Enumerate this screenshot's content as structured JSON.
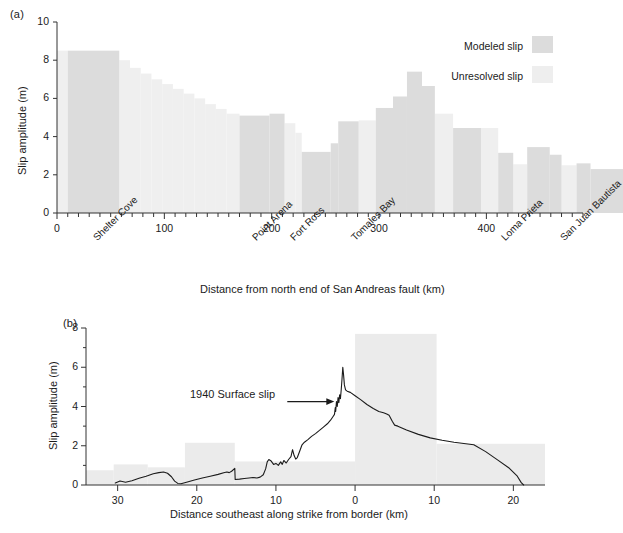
{
  "figure": {
    "panel_a_label": "(a)",
    "panel_b_label": "(b)"
  },
  "legend": {
    "modeled_label": "Modeled slip",
    "unresolved_label": "Unresolved slip",
    "modeled_color": "#dcdcdc",
    "unresolved_color": "#eeeeee"
  },
  "panel_a": {
    "ylabel": "Slip amplitude (m)",
    "xlabel": "Distance from north end of San Andreas fault (km)",
    "yticks": [
      "0",
      "2",
      "4",
      "6",
      "8",
      "10"
    ],
    "xticks": [
      "0",
      "100",
      "200",
      "300",
      "400"
    ],
    "categories": [
      {
        "label": "Shelter Cove",
        "km": 30
      },
      {
        "label": "Point Arena",
        "km": 178
      },
      {
        "label": "Fort Ross",
        "km": 213
      },
      {
        "label": "Tomales Bay",
        "km": 270
      },
      {
        "label": "Loma Prieta",
        "km": 410
      },
      {
        "label": "San Juan Bautista",
        "km": 465
      }
    ]
  },
  "panel_b": {
    "ylabel": "Slip amplitude (m)",
    "xlabel": "Distance southeast along strike from border (km)",
    "yticks": [
      "0",
      "2",
      "4",
      "6",
      "8"
    ],
    "xticks": [
      "30",
      "20",
      "10",
      "0",
      "10",
      "20"
    ],
    "annotation": "1940 Surface slip"
  },
  "chart_data": [
    {
      "type": "bar",
      "title": "(a)",
      "xlabel": "Distance from north end of San Andreas fault (km)",
      "ylabel": "Slip amplitude (m)",
      "xlim": [
        0,
        490
      ],
      "ylim": [
        0,
        10
      ],
      "grid": false,
      "legend_position": "top-right",
      "series": [
        {
          "name": "Modeled slip",
          "color": "#dcdcdc",
          "bars": [
            {
              "x0": 10,
              "x1": 58,
              "value": 8.5
            },
            {
              "x0": 170,
              "x1": 198,
              "value": 5.1
            },
            {
              "x0": 198,
              "x1": 212,
              "value": 5.2
            },
            {
              "x0": 228,
              "x1": 255,
              "value": 3.2
            },
            {
              "x0": 255,
              "x1": 262,
              "value": 3.65
            },
            {
              "x0": 262,
              "x1": 281,
              "value": 4.8
            },
            {
              "x0": 297,
              "x1": 313,
              "value": 5.5
            },
            {
              "x0": 313,
              "x1": 326,
              "value": 6.1
            },
            {
              "x0": 326,
              "x1": 340,
              "value": 7.4
            },
            {
              "x0": 340,
              "x1": 352,
              "value": 6.65
            },
            {
              "x0": 369,
              "x1": 395,
              "value": 4.45
            },
            {
              "x0": 411,
              "x1": 425,
              "value": 3.15
            },
            {
              "x0": 438,
              "x1": 459,
              "value": 3.45
            },
            {
              "x0": 459,
              "x1": 470,
              "value": 3.05
            },
            {
              "x0": 484,
              "x1": 497,
              "value": 2.6
            },
            {
              "x0": 497,
              "x1": 530,
              "value": 2.3
            }
          ]
        },
        {
          "name": "Unresolved slip",
          "color": "#efefef",
          "bars": [
            {
              "x0": 0,
              "x1": 10,
              "value": 8.5
            },
            {
              "x0": 58,
              "x1": 68,
              "value": 8.0
            },
            {
              "x0": 68,
              "x1": 78,
              "value": 7.6
            },
            {
              "x0": 78,
              "x1": 88,
              "value": 7.3
            },
            {
              "x0": 88,
              "x1": 98,
              "value": 7.0
            },
            {
              "x0": 98,
              "x1": 108,
              "value": 6.75
            },
            {
              "x0": 108,
              "x1": 118,
              "value": 6.5
            },
            {
              "x0": 118,
              "x1": 128,
              "value": 6.25
            },
            {
              "x0": 128,
              "x1": 138,
              "value": 6.0
            },
            {
              "x0": 138,
              "x1": 148,
              "value": 5.7
            },
            {
              "x0": 148,
              "x1": 158,
              "value": 5.45
            },
            {
              "x0": 158,
              "x1": 170,
              "value": 5.2
            },
            {
              "x0": 212,
              "x1": 222,
              "value": 4.7
            },
            {
              "x0": 222,
              "x1": 228,
              "value": 4.2
            },
            {
              "x0": 281,
              "x1": 297,
              "value": 4.85
            },
            {
              "x0": 352,
              "x1": 369,
              "value": 5.2
            },
            {
              "x0": 395,
              "x1": 411,
              "value": 4.45
            },
            {
              "x0": 425,
              "x1": 438,
              "value": 2.55
            },
            {
              "x0": 470,
              "x1": 484,
              "value": 2.5
            }
          ]
        }
      ]
    },
    {
      "type": "line",
      "title": "(b)",
      "xlabel": "Distance southeast along strike from border (km)",
      "ylabel": "Slip amplitude (m)",
      "xlim": [
        -34,
        24
      ],
      "ylim": [
        0,
        8
      ],
      "grid": false,
      "annotations": [
        {
          "text": "1940 Surface slip",
          "x": -2.3,
          "y": 4.25
        }
      ],
      "background_bars": {
        "name": "Unresolved slip",
        "color": "#ebebeb",
        "bars": [
          {
            "x0": -34,
            "x1": -30.5,
            "value": 0.75
          },
          {
            "x0": -30.5,
            "x1": -26.2,
            "value": 1.05
          },
          {
            "x0": -26.2,
            "x1": -21.5,
            "value": 0.9
          },
          {
            "x0": -21.5,
            "x1": -15.2,
            "value": 2.15
          },
          {
            "x0": -15.2,
            "x1": 0.0,
            "value": 1.2
          },
          {
            "x0": 0.0,
            "x1": 10.3,
            "value": 7.7
          },
          {
            "x0": 10.3,
            "x1": 24.0,
            "value": 2.1
          }
        ]
      },
      "series": [
        {
          "name": "1940 Surface slip",
          "color": "#1b1b1b",
          "points": [
            [
              -30.3,
              0.1
            ],
            [
              -29.7,
              0.2
            ],
            [
              -29.0,
              0.14
            ],
            [
              -28.2,
              0.22
            ],
            [
              -27.3,
              0.34
            ],
            [
              -26.4,
              0.45
            ],
            [
              -25.5,
              0.57
            ],
            [
              -24.8,
              0.63
            ],
            [
              -24.2,
              0.66
            ],
            [
              -23.7,
              0.6
            ],
            [
              -23.2,
              0.42
            ],
            [
              -22.8,
              0.2
            ],
            [
              -22.4,
              0.08
            ],
            [
              -22.0,
              0.06
            ],
            [
              -21.3,
              0.14
            ],
            [
              -20.3,
              0.25
            ],
            [
              -19.3,
              0.36
            ],
            [
              -18.3,
              0.45
            ],
            [
              -17.3,
              0.54
            ],
            [
              -16.6,
              0.62
            ],
            [
              -16.2,
              0.66
            ],
            [
              -15.9,
              0.63
            ],
            [
              -15.6,
              0.7
            ],
            [
              -15.2,
              0.85
            ],
            [
              -15.15,
              0.28
            ],
            [
              -14.6,
              0.3
            ],
            [
              -14.0,
              0.33
            ],
            [
              -13.4,
              0.36
            ],
            [
              -12.9,
              0.38
            ],
            [
              -12.4,
              0.36
            ],
            [
              -12.0,
              0.4
            ],
            [
              -11.6,
              0.52
            ],
            [
              -11.3,
              0.82
            ],
            [
              -11.1,
              1.18
            ],
            [
              -10.9,
              1.3
            ],
            [
              -10.6,
              1.22
            ],
            [
              -10.3,
              1.05
            ],
            [
              -10.0,
              1.1
            ],
            [
              -9.7,
              1.0
            ],
            [
              -9.4,
              1.18
            ],
            [
              -9.2,
              1.05
            ],
            [
              -9.0,
              1.25
            ],
            [
              -8.7,
              1.12
            ],
            [
              -8.4,
              1.3
            ],
            [
              -8.1,
              1.45
            ],
            [
              -7.9,
              1.8
            ],
            [
              -7.7,
              1.5
            ],
            [
              -7.5,
              1.32
            ],
            [
              -7.3,
              1.4
            ],
            [
              -7.0,
              1.72
            ],
            [
              -6.7,
              2.05
            ],
            [
              -6.4,
              2.18
            ],
            [
              -6.0,
              2.3
            ],
            [
              -5.5,
              2.48
            ],
            [
              -5.0,
              2.62
            ],
            [
              -4.5,
              2.78
            ],
            [
              -4.0,
              2.95
            ],
            [
              -3.5,
              3.12
            ],
            [
              -3.1,
              3.3
            ],
            [
              -2.8,
              3.48
            ],
            [
              -2.6,
              3.6
            ],
            [
              -2.5,
              3.95
            ],
            [
              -2.45,
              3.75
            ],
            [
              -2.35,
              4.25
            ],
            [
              -2.25,
              4.0
            ],
            [
              -2.15,
              4.45
            ],
            [
              -2.05,
              4.2
            ],
            [
              -1.95,
              4.6
            ],
            [
              -1.85,
              4.4
            ],
            [
              -1.75,
              4.85
            ],
            [
              -1.65,
              5.4
            ],
            [
              -1.55,
              6.0
            ],
            [
              -1.45,
              5.6
            ],
            [
              -1.35,
              5.1
            ],
            [
              -1.2,
              4.85
            ],
            [
              -1.0,
              4.78
            ],
            [
              -0.6,
              4.72
            ],
            [
              0.0,
              4.55
            ],
            [
              0.7,
              4.35
            ],
            [
              1.5,
              4.1
            ],
            [
              2.3,
              3.9
            ],
            [
              3.0,
              3.75
            ],
            [
              3.6,
              3.68
            ],
            [
              4.0,
              3.62
            ],
            [
              4.3,
              3.55
            ],
            [
              4.7,
              3.25
            ],
            [
              5.0,
              3.05
            ],
            [
              5.4,
              3.0
            ],
            [
              6.5,
              2.8
            ],
            [
              8.0,
              2.58
            ],
            [
              9.5,
              2.4
            ],
            [
              11.0,
              2.28
            ],
            [
              12.5,
              2.18
            ],
            [
              14.0,
              2.1
            ],
            [
              15.0,
              2.05
            ],
            [
              16.5,
              1.7
            ],
            [
              18.0,
              1.28
            ],
            [
              19.5,
              0.85
            ],
            [
              20.5,
              0.45
            ],
            [
              21.0,
              0.12
            ],
            [
              21.3,
              0.0
            ]
          ]
        }
      ]
    }
  ]
}
